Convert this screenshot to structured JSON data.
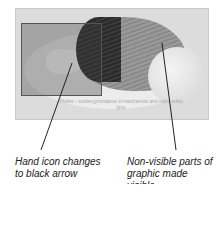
{
  "figure": {
    "image_caption": "Pfufant – sockerygrrondance in\nmarchanistic and mains solkis grvo",
    "colors": {
      "frame_bg": "#dcdcdc",
      "highlight_border": "#555555",
      "leader": "#222222",
      "label_text": "#222222"
    }
  },
  "callouts": [
    {
      "text_line1": "Hand icon changes",
      "text_line2": "to black arrow"
    },
    {
      "text_line1": "Non-visible parts of",
      "text_line2": "graphic made visible"
    }
  ]
}
